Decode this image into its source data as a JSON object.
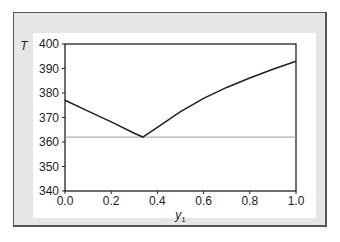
{
  "chart_data": {
    "type": "line",
    "title": "",
    "xlabel": "y1",
    "ylabel": "T",
    "xlim": [
      0.0,
      1.0
    ],
    "ylim": [
      340,
      400
    ],
    "xticks": [
      "0.0",
      "0.2",
      "0.4",
      "0.6",
      "0.8",
      "1.0"
    ],
    "yticks": [
      "340",
      "350",
      "360",
      "370",
      "380",
      "390",
      "400"
    ],
    "grid": false,
    "legend": null,
    "series": [
      {
        "name": "T vs y1",
        "x": [
          0.0,
          0.1,
          0.2,
          0.3,
          0.337,
          0.4,
          0.5,
          0.6,
          0.7,
          0.8,
          0.9,
          1.0
        ],
        "y": [
          377.0,
          372.6,
          368.2,
          363.6,
          362.0,
          366.0,
          372.4,
          377.8,
          382.3,
          386.1,
          389.7,
          393.0
        ]
      },
      {
        "name": "reference line",
        "x": [
          0.0,
          1.0
        ],
        "y": [
          362.0,
          362.0
        ]
      }
    ],
    "colors": {
      "curve": "#222222",
      "reference": "#999999",
      "frame_bg": "#e6e6e6"
    }
  }
}
